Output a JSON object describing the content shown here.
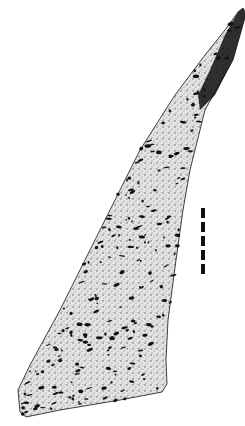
{
  "figure": {
    "type": "stippled-illustration",
    "colors": {
      "background": "#ffffff",
      "ink": "#111111",
      "stipple_light": "#9a9a9a",
      "fill": "#d9d9d9"
    },
    "outline_points": [
      [
        243,
        8
      ],
      [
        246,
        14
      ],
      [
        233,
        60
      ],
      [
        205,
        110
      ],
      [
        190,
        170
      ],
      [
        183,
        210
      ],
      [
        176,
        260
      ],
      [
        168,
        320
      ],
      [
        166,
        360
      ],
      [
        167,
        384
      ],
      [
        162,
        392
      ],
      [
        120,
        400
      ],
      [
        60,
        410
      ],
      [
        26,
        417
      ],
      [
        20,
        412
      ],
      [
        18,
        390
      ],
      [
        30,
        365
      ],
      [
        60,
        310
      ],
      [
        100,
        230
      ],
      [
        140,
        150
      ],
      [
        175,
        95
      ],
      [
        205,
        55
      ],
      [
        225,
        30
      ],
      [
        238,
        12
      ]
    ],
    "dark_tip_region": [
      [
        243,
        8
      ],
      [
        246,
        14
      ],
      [
        233,
        60
      ],
      [
        215,
        95
      ],
      [
        200,
        110
      ],
      [
        198,
        95
      ],
      [
        210,
        70
      ],
      [
        225,
        35
      ],
      [
        238,
        12
      ]
    ],
    "scale_bar": {
      "x": 201,
      "y_start": 208,
      "segments": 5,
      "segment_length": 10,
      "gap": 4,
      "width": 4
    }
  }
}
